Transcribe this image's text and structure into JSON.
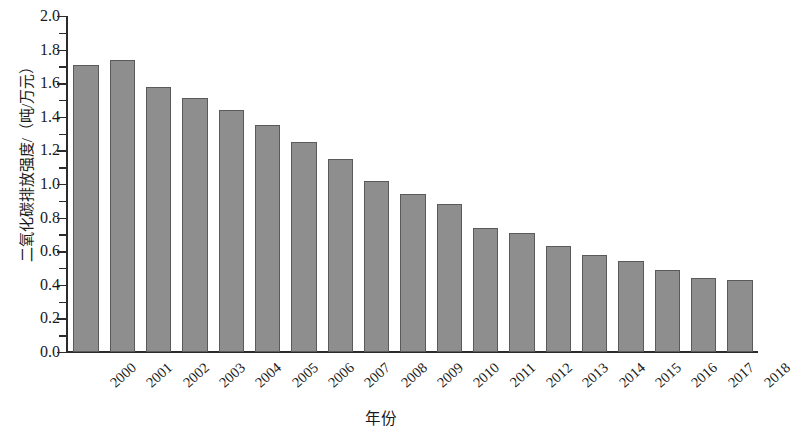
{
  "chart_data": {
    "type": "bar",
    "title": "",
    "xlabel": "年份",
    "ylabel": "二氧化碳排放强度/（吨/万元）",
    "categories": [
      "2000",
      "2001",
      "2002",
      "2003",
      "2004",
      "2005",
      "2006",
      "2007",
      "2008",
      "2009",
      "2010",
      "2011",
      "2012",
      "2013",
      "2014",
      "2015",
      "2016",
      "2017",
      "2018"
    ],
    "values": [
      1.71,
      1.74,
      1.58,
      1.51,
      1.44,
      1.35,
      1.25,
      1.15,
      1.02,
      0.94,
      0.88,
      0.74,
      0.71,
      0.63,
      0.58,
      0.54,
      0.49,
      0.44,
      0.43
    ],
    "series": [
      {
        "name": "二氧化碳排放强度",
        "values": [
          1.71,
          1.74,
          1.58,
          1.51,
          1.44,
          1.35,
          1.25,
          1.15,
          1.02,
          0.94,
          0.88,
          0.74,
          0.71,
          0.63,
          0.58,
          0.54,
          0.49,
          0.44,
          0.43
        ]
      }
    ],
    "ylim": [
      0.0,
      2.0
    ],
    "ytick_labels": [
      "2.0",
      "1.8",
      "1.6",
      "1.4",
      "1.2",
      "1.0",
      "0.8",
      "0.6",
      "0.4",
      "0.2",
      "0.0"
    ],
    "ytick_values": [
      2.0,
      1.8,
      1.6,
      1.4,
      1.2,
      1.0,
      0.8,
      0.6,
      0.4,
      0.2,
      0.0
    ],
    "yminor_values": [
      1.9,
      1.7,
      1.5,
      1.3,
      1.1,
      0.9,
      0.7,
      0.5,
      0.3,
      0.1
    ],
    "grid": false,
    "legend": null,
    "legend_position": "none",
    "bar_color": "#8e8e8e",
    "bar_edge_color": "#5a5a5a",
    "axis_color": "#2b2b2b",
    "background_color": "#ffffff",
    "xtick_rotation": -42
  }
}
